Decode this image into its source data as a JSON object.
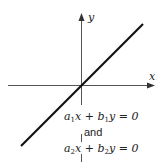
{
  "diagram": {
    "axes": {
      "x_label": "x",
      "y_label": "y"
    },
    "line": {
      "description": "line through origin",
      "color": "#111111"
    },
    "equations": {
      "eq1": {
        "a": "a",
        "a_sub": "1",
        "b": "b",
        "b_sub": "1",
        "rest_x": "x + ",
        "rest_y": "y = 0"
      },
      "connector": "and",
      "eq2": {
        "a": "a",
        "a_sub": "2",
        "b": "b",
        "b_sub": "2",
        "rest_x": "x + ",
        "rest_y": "y = 0"
      }
    }
  }
}
